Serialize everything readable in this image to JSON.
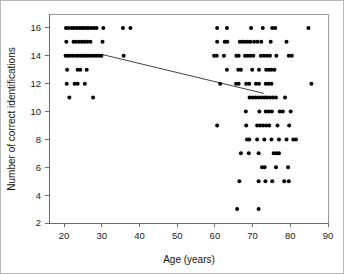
{
  "chart_data": {
    "type": "scatter",
    "title": "",
    "xlabel": "Age (years)",
    "ylabel": "Number of correct identifications",
    "xlim": [
      16,
      90
    ],
    "ylim": [
      2,
      17
    ],
    "xticks": [
      20,
      30,
      40,
      50,
      60,
      70,
      80,
      90
    ],
    "yticks": [
      2,
      4,
      6,
      8,
      10,
      12,
      14,
      16
    ],
    "grid": false,
    "legend": null,
    "marker": {
      "shape": "circle",
      "color": "#000000",
      "size": 2.0
    },
    "trendline": {
      "type": "linear-fit",
      "color": "#2b2b2b",
      "x_start": 30.0,
      "y_start": 14.1,
      "x_end": 73.0,
      "y_end": 11.3
    },
    "points": [
      [
        20.5,
        16
      ],
      [
        21.2,
        16
      ],
      [
        22.0,
        16
      ],
      [
        22.6,
        16
      ],
      [
        23.3,
        16
      ],
      [
        24.0,
        16
      ],
      [
        24.6,
        16
      ],
      [
        25.2,
        16
      ],
      [
        25.9,
        16
      ],
      [
        26.5,
        16
      ],
      [
        27.2,
        16
      ],
      [
        27.9,
        16
      ],
      [
        28.6,
        16
      ],
      [
        30.4,
        16
      ],
      [
        35.6,
        16
      ],
      [
        37.6,
        16
      ],
      [
        60.6,
        16
      ],
      [
        63.2,
        16
      ],
      [
        69.6,
        16
      ],
      [
        72.7,
        16
      ],
      [
        75.2,
        16
      ],
      [
        76.0,
        16
      ],
      [
        84.8,
        16
      ],
      [
        20.6,
        15
      ],
      [
        22.5,
        15
      ],
      [
        23.2,
        15
      ],
      [
        24.0,
        15
      ],
      [
        24.7,
        15
      ],
      [
        25.4,
        15
      ],
      [
        26.2,
        15
      ],
      [
        27.0,
        15
      ],
      [
        30.2,
        15
      ],
      [
        60.6,
        15
      ],
      [
        62.6,
        15
      ],
      [
        63.3,
        15
      ],
      [
        66.6,
        15
      ],
      [
        67.3,
        15
      ],
      [
        68.0,
        15
      ],
      [
        68.7,
        15
      ],
      [
        69.4,
        15
      ],
      [
        70.4,
        15
      ],
      [
        71.3,
        15
      ],
      [
        72.3,
        15
      ],
      [
        74.8,
        15
      ],
      [
        79.0,
        15
      ],
      [
        20.4,
        14
      ],
      [
        21.0,
        14
      ],
      [
        21.6,
        14
      ],
      [
        22.3,
        14
      ],
      [
        23.1,
        14
      ],
      [
        23.8,
        14
      ],
      [
        24.5,
        14
      ],
      [
        25.1,
        14
      ],
      [
        25.8,
        14
      ],
      [
        26.4,
        14
      ],
      [
        27.1,
        14
      ],
      [
        27.8,
        14
      ],
      [
        28.5,
        14
      ],
      [
        29.2,
        14
      ],
      [
        29.9,
        14
      ],
      [
        35.8,
        14
      ],
      [
        59.8,
        14
      ],
      [
        60.5,
        14
      ],
      [
        62.4,
        14
      ],
      [
        65.7,
        14
      ],
      [
        66.3,
        14
      ],
      [
        68.0,
        14
      ],
      [
        68.7,
        14
      ],
      [
        69.4,
        14
      ],
      [
        70.2,
        14
      ],
      [
        72.2,
        14
      ],
      [
        73.0,
        14
      ],
      [
        73.8,
        14
      ],
      [
        74.6,
        14
      ],
      [
        76.3,
        14
      ],
      [
        79.6,
        14
      ],
      [
        80.4,
        14
      ],
      [
        20.8,
        13
      ],
      [
        23.6,
        13
      ],
      [
        24.3,
        13
      ],
      [
        26.0,
        13
      ],
      [
        63.2,
        13
      ],
      [
        66.2,
        13
      ],
      [
        66.9,
        13
      ],
      [
        69.9,
        13
      ],
      [
        71.7,
        13
      ],
      [
        73.6,
        13
      ],
      [
        74.3,
        13
      ],
      [
        75.0,
        13
      ],
      [
        75.8,
        13
      ],
      [
        20.7,
        12
      ],
      [
        22.8,
        12
      ],
      [
        23.6,
        12
      ],
      [
        25.5,
        12
      ],
      [
        61.4,
        12
      ],
      [
        65.6,
        12
      ],
      [
        66.3,
        12
      ],
      [
        68.3,
        12
      ],
      [
        69.1,
        12
      ],
      [
        70.9,
        12
      ],
      [
        71.7,
        12
      ],
      [
        73.5,
        12
      ],
      [
        74.2,
        12
      ],
      [
        75.0,
        12
      ],
      [
        85.6,
        12
      ],
      [
        21.4,
        11
      ],
      [
        27.7,
        11
      ],
      [
        69.2,
        11
      ],
      [
        70.0,
        11
      ],
      [
        70.8,
        11
      ],
      [
        71.6,
        11
      ],
      [
        72.4,
        11
      ],
      [
        73.1,
        11
      ],
      [
        73.8,
        11
      ],
      [
        74.6,
        11
      ],
      [
        75.4,
        11
      ],
      [
        76.2,
        11
      ],
      [
        78.6,
        11
      ],
      [
        68.2,
        10
      ],
      [
        71.8,
        10
      ],
      [
        73.5,
        10
      ],
      [
        74.3,
        10
      ],
      [
        75.1,
        10
      ],
      [
        77.2,
        10
      ],
      [
        78.0,
        10
      ],
      [
        80.1,
        10
      ],
      [
        60.6,
        9
      ],
      [
        68.3,
        9
      ],
      [
        71.2,
        9
      ],
      [
        72.0,
        9
      ],
      [
        72.8,
        9
      ],
      [
        73.6,
        9
      ],
      [
        74.4,
        9
      ],
      [
        76.6,
        9
      ],
      [
        79.7,
        9
      ],
      [
        68.5,
        8
      ],
      [
        69.1,
        8
      ],
      [
        71.2,
        8
      ],
      [
        73.1,
        8
      ],
      [
        75.0,
        8
      ],
      [
        77.0,
        8
      ],
      [
        79.0,
        8
      ],
      [
        80.8,
        8
      ],
      [
        81.5,
        8
      ],
      [
        66.9,
        7
      ],
      [
        69.0,
        7
      ],
      [
        71.6,
        7
      ],
      [
        75.6,
        7
      ],
      [
        76.3,
        7
      ],
      [
        77.0,
        7
      ],
      [
        72.5,
        6
      ],
      [
        73.2,
        6
      ],
      [
        76.2,
        6
      ],
      [
        79.4,
        6
      ],
      [
        66.5,
        5
      ],
      [
        71.6,
        5
      ],
      [
        73.4,
        5
      ],
      [
        75.2,
        5
      ],
      [
        78.4,
        5
      ],
      [
        79.6,
        5
      ],
      [
        65.9,
        3
      ],
      [
        71.6,
        3
      ]
    ]
  },
  "figure": {
    "border_color": "#b9b9b9",
    "axis_color": "#6a6a6a",
    "point_color": "#000000"
  }
}
